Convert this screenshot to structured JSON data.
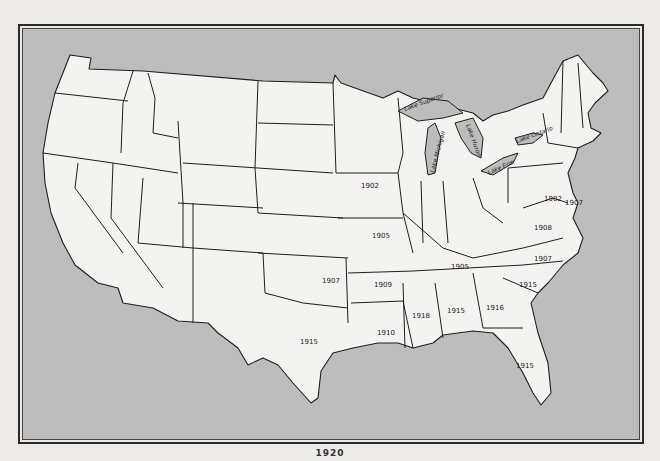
{
  "map": {
    "title": "United States",
    "colors": {
      "land": "#f3f3f1",
      "water": "#bdbdbd",
      "border": "#1f1f1f",
      "page": "#ecebe8"
    },
    "lakes": [
      {
        "name": "Lake Superior",
        "label": "Lake Superior"
      },
      {
        "name": "Lake Michigan",
        "label": "Lake Michigan"
      },
      {
        "name": "Lake Huron",
        "label": "Lake Huron"
      },
      {
        "name": "Lake Erie",
        "label": "Lake Erie"
      },
      {
        "name": "Lake Ontario",
        "label": "Lake Ontario"
      }
    ],
    "state_years": [
      {
        "state": "Iowa",
        "year": "1902"
      },
      {
        "state": "Missouri",
        "year": "1905"
      },
      {
        "state": "Oklahoma",
        "year": "1907"
      },
      {
        "state": "Arkansas",
        "year": "1909"
      },
      {
        "state": "Tennessee",
        "year": "1905"
      },
      {
        "state": "Virginia",
        "year": "1908"
      },
      {
        "state": "North Carolina",
        "year": "1907"
      },
      {
        "state": "South Carolina",
        "year": "1915"
      },
      {
        "state": "Texas",
        "year": "1915"
      },
      {
        "state": "Louisiana",
        "year": "1910"
      },
      {
        "state": "Mississippi",
        "year": "1918"
      },
      {
        "state": "Alabama",
        "year": "1915"
      },
      {
        "state": "Georgia",
        "year": "1916"
      },
      {
        "state": "Florida",
        "year": "1915"
      },
      {
        "state": "Maryland",
        "year": "1902"
      },
      {
        "state": "Delaware",
        "year": "1907"
      }
    ]
  },
  "caption": {
    "text": "1920"
  }
}
